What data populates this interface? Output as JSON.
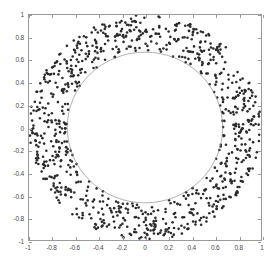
{
  "chart_data": {
    "type": "scatter",
    "title": "",
    "subtitle": "",
    "xlabel": "",
    "ylabel": "",
    "xlim": [
      -1,
      1
    ],
    "ylim": [
      -1,
      1
    ],
    "grid": false,
    "legend": null,
    "legend_position": "none",
    "xticks": [
      "-1",
      "-0.8",
      "-0.6",
      "-0.4",
      "-0.2",
      "0",
      "0.2",
      "0.4",
      "0.6",
      "0.8",
      "1"
    ],
    "xtick_values": [
      -1,
      -0.8,
      -0.6,
      -0.4,
      -0.2,
      0,
      0.2,
      0.4,
      0.6,
      0.8,
      1
    ],
    "yticks": [
      "-1",
      "-0.8",
      "-0.6",
      "-0.4",
      "-0.2",
      "0",
      "0.2",
      "0.4",
      "0.6",
      "0.8",
      "1"
    ],
    "ytick_values": [
      -1,
      -0.8,
      -0.6,
      -0.4,
      -0.2,
      0,
      0.2,
      0.4,
      0.6,
      0.8,
      1
    ],
    "annotations": [],
    "series": [
      {
        "name": "annulus-points",
        "marker": "dot",
        "marker_size": 1.3,
        "color": "#2b2b2b",
        "point_count": 900,
        "inner_radius": 0.67,
        "outer_radius": 1.0,
        "center": [
          0,
          0
        ]
      }
    ],
    "shapes": [
      {
        "name": "inner-circle",
        "type": "circle",
        "center": [
          0,
          0
        ],
        "radius": 0.67,
        "stroke": "#8c8c8c",
        "fill": "none",
        "stroke_width": 0.7
      }
    ],
    "colors": {
      "marker": "#2b2b2b",
      "circle_stroke": "#8c8c8c",
      "axis": "#9a9a9a",
      "tick_label": "#4a4a4a",
      "background": "#ffffff"
    }
  }
}
